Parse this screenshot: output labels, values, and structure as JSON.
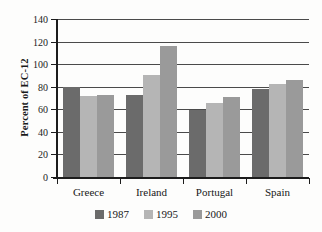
{
  "chart_data": {
    "type": "bar",
    "title": "",
    "subtitle": "",
    "xlabel": "",
    "ylabel": "Percent of EC-12",
    "categories": [
      "Greece",
      "Ireland",
      "Portugal",
      "Spain"
    ],
    "series": [
      {
        "name": "1987",
        "color": "#6b6b6b",
        "values": [
          80,
          73,
          59,
          78
        ]
      },
      {
        "name": "1995",
        "color": "#b5b5b5",
        "values": [
          72,
          90,
          66,
          82
        ]
      },
      {
        "name": "2000",
        "color": "#9a9a9a",
        "values": [
          73,
          116,
          71,
          86
        ]
      }
    ],
    "ylim": [
      0,
      140
    ],
    "ytick_step": 20,
    "yticks": [
      140,
      120,
      100,
      80,
      60,
      40,
      20,
      0
    ],
    "ytick_labels": [
      "140",
      "120",
      "100",
      "80",
      "60",
      "40",
      "20",
      "0"
    ],
    "grid": true,
    "grid_axis": "y",
    "legend_position": "bottom",
    "annotations": []
  },
  "colors": {
    "axis": "#1c1c1c",
    "grid": "#4a4a4a",
    "background": "#fdfdfc",
    "text": "#181818"
  }
}
